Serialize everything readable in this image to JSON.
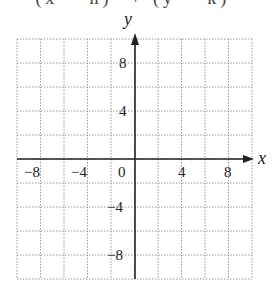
{
  "header": {
    "cropped_equation": "(x − h)²  +  (y − k)²"
  },
  "chart_data": {
    "type": "line",
    "title": "",
    "xlabel": "x",
    "ylabel": "y",
    "xlim": [
      -10,
      10
    ],
    "ylim": [
      -10,
      10
    ],
    "grid": true,
    "grid_step": 2,
    "x_ticks": [
      -8,
      -4,
      0,
      4,
      8
    ],
    "y_ticks": [
      8,
      4,
      -4,
      -8
    ],
    "x_tick_labels": [
      "−8",
      "−4",
      "0",
      "4",
      "8"
    ],
    "y_tick_labels": [
      "8",
      "4",
      "−4",
      "−8"
    ],
    "series": []
  }
}
